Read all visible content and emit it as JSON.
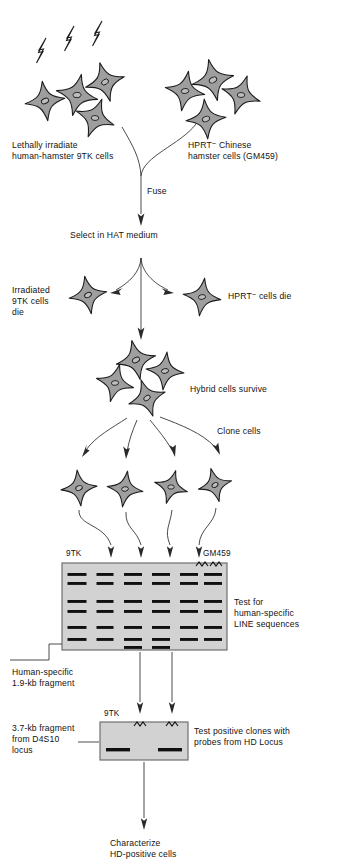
{
  "figure": {
    "title_domain": "somatic-cell-hybrid-mapping-flowchart",
    "background": "#ffffff",
    "ink": "#141414"
  },
  "colors": {
    "cell_fill": "#9e9e9e",
    "cell_outline": "#1c1c1c",
    "nucleus_fill": "#bdbdbd",
    "gel_fill": "#d2d2d2",
    "gel_border": "#6f6f6f",
    "band": "#101010",
    "line": "#2a2a2a"
  },
  "labels": {
    "irradiate_source": "Lethally irradiate\nhuman-hamster 9TK cells",
    "hprt_source_pre": "HPRT",
    "hprt_source_sup": "−",
    "hprt_source_post": " Chinese\nhamster cells (GM459)",
    "fuse": "Fuse",
    "select_hat": "Select in HAT medium",
    "irradiated_die": "Irradiated\n9TK cells\ndie",
    "hprt_die_pre": "HPRT",
    "hprt_die_sup": "−",
    "hprt_die_post": " cells die",
    "hybrid_survive": "Hybrid cells survive",
    "clone_cells": "Clone cells",
    "gel1_left_lane": "9TK",
    "gel1_right_lane": "GM459",
    "test_line": "Test for\nhuman-specific\nLINE sequences",
    "human_specific_fragment": "Human-specific\n1.9-kb fragment",
    "gel2_left_lane": "9TK",
    "fragment_d4s10": "3.7-kb fragment\nfrom D4S10\nlocus",
    "test_hd_probes": "Test positive  clones with\nprobes from HD Locus",
    "characterize": "Characterize\nHD-positive cells"
  },
  "cells": {
    "irradiated_group": [
      {
        "x": 45,
        "y": 101,
        "r": 20,
        "rot": -8
      },
      {
        "x": 77,
        "y": 95,
        "r": 21,
        "rot": 12
      },
      {
        "x": 105,
        "y": 82,
        "r": 20,
        "rot": -15
      },
      {
        "x": 95,
        "y": 118,
        "r": 20,
        "rot": 20
      }
    ],
    "hprt_group": [
      {
        "x": 185,
        "y": 91,
        "r": 20,
        "rot": 10
      },
      {
        "x": 213,
        "y": 80,
        "r": 21,
        "rot": -12
      },
      {
        "x": 241,
        "y": 95,
        "r": 20,
        "rot": 18
      },
      {
        "x": 206,
        "y": 119,
        "r": 20,
        "rot": -5
      }
    ],
    "die_left": {
      "x": 88,
      "y": 295,
      "r": 19,
      "rot": -10
    },
    "die_right": {
      "x": 202,
      "y": 297,
      "r": 19,
      "rot": 8
    },
    "hybrid_group": [
      {
        "x": 136,
        "y": 360,
        "r": 20,
        "rot": -12
      },
      {
        "x": 115,
        "y": 383,
        "r": 19,
        "rot": 14
      },
      {
        "x": 165,
        "y": 371,
        "r": 19,
        "rot": 6
      },
      {
        "x": 147,
        "y": 398,
        "r": 19,
        "rot": -18
      }
    ],
    "clone_row": [
      {
        "x": 79,
        "y": 488,
        "r": 18,
        "rot": -6
      },
      {
        "x": 125,
        "y": 489,
        "r": 18,
        "rot": 8
      },
      {
        "x": 171,
        "y": 487,
        "r": 17,
        "rot": 16
      },
      {
        "x": 215,
        "y": 485,
        "r": 17,
        "rot": -14
      }
    ]
  },
  "lightning_bolts": [
    {
      "x": 39,
      "y": 42
    },
    {
      "x": 67,
      "y": 30
    },
    {
      "x": 95,
      "y": 25
    }
  ],
  "gel1": {
    "x": 62,
    "y": 563,
    "w": 165,
    "h": 87,
    "lane_count": 6,
    "lane_centers": [
      77,
      105,
      133,
      161,
      189,
      213
    ],
    "bands": [
      {
        "lane": 0,
        "y": 573,
        "w": 19
      },
      {
        "lane": 0,
        "y": 582,
        "w": 19
      },
      {
        "lane": 0,
        "y": 600,
        "w": 19
      },
      {
        "lane": 0,
        "y": 610,
        "w": 19
      },
      {
        "lane": 0,
        "y": 626,
        "w": 19
      },
      {
        "lane": 0,
        "y": 638,
        "w": 19
      },
      {
        "lane": 1,
        "y": 573,
        "w": 17
      },
      {
        "lane": 1,
        "y": 582,
        "w": 17
      },
      {
        "lane": 1,
        "y": 600,
        "w": 17
      },
      {
        "lane": 1,
        "y": 610,
        "w": 17
      },
      {
        "lane": 1,
        "y": 626,
        "w": 17
      },
      {
        "lane": 1,
        "y": 638,
        "w": 17
      },
      {
        "lane": 2,
        "y": 573,
        "w": 18
      },
      {
        "lane": 2,
        "y": 582,
        "w": 18
      },
      {
        "lane": 2,
        "y": 600,
        "w": 18
      },
      {
        "lane": 2,
        "y": 610,
        "w": 18
      },
      {
        "lane": 2,
        "y": 626,
        "w": 18
      },
      {
        "lane": 2,
        "y": 638,
        "w": 18
      },
      {
        "lane": 2,
        "y": 646,
        "w": 18
      },
      {
        "lane": 3,
        "y": 573,
        "w": 18
      },
      {
        "lane": 3,
        "y": 582,
        "w": 18
      },
      {
        "lane": 3,
        "y": 600,
        "w": 18
      },
      {
        "lane": 3,
        "y": 610,
        "w": 18
      },
      {
        "lane": 3,
        "y": 626,
        "w": 18
      },
      {
        "lane": 3,
        "y": 638,
        "w": 18
      },
      {
        "lane": 3,
        "y": 646,
        "w": 18
      },
      {
        "lane": 4,
        "y": 573,
        "w": 18
      },
      {
        "lane": 4,
        "y": 582,
        "w": 18
      },
      {
        "lane": 4,
        "y": 600,
        "w": 18
      },
      {
        "lane": 4,
        "y": 610,
        "w": 18
      },
      {
        "lane": 4,
        "y": 626,
        "w": 18
      },
      {
        "lane": 4,
        "y": 638,
        "w": 18
      },
      {
        "lane": 5,
        "y": 573,
        "w": 18
      },
      {
        "lane": 5,
        "y": 582,
        "w": 18
      },
      {
        "lane": 5,
        "y": 600,
        "w": 18
      },
      {
        "lane": 5,
        "y": 610,
        "w": 18
      },
      {
        "lane": 5,
        "y": 626,
        "w": 18
      },
      {
        "lane": 5,
        "y": 638,
        "w": 18
      }
    ],
    "inlet_arrows_x": [
      111,
      141,
      170,
      199
    ]
  },
  "gel2": {
    "x": 100,
    "y": 722,
    "w": 88,
    "h": 38,
    "bands": [
      {
        "cx": 118,
        "cy": 748,
        "w": 24
      },
      {
        "cx": 170,
        "cy": 748,
        "w": 24
      }
    ],
    "inlet_arrows_x": [
      140,
      172
    ]
  }
}
